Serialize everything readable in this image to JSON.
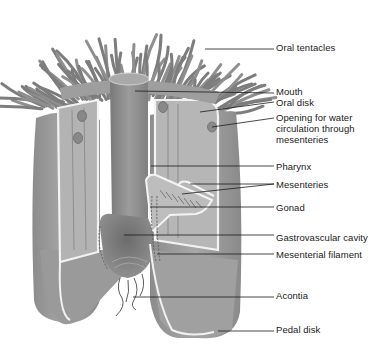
{
  "diagram": {
    "colors": {
      "body": "#9a9a9a",
      "body_light": "#b8b8b8",
      "body_dark": "#6e6e6e",
      "tentacle": "#7d7d7d",
      "edge_highlight": "#f2f2f2",
      "leader_line": "#1a1a1a",
      "text": "#1a1a1a",
      "background": "#ffffff"
    },
    "labels": [
      {
        "id": "oral-tentacles",
        "lines": [
          "Oral tentacles"
        ],
        "x": 276,
        "y": 42,
        "line": {
          "x1": 205,
          "y1": 49,
          "x2": 274,
          "y2": 49
        }
      },
      {
        "id": "mouth",
        "lines": [
          "Mouth"
        ],
        "x": 276,
        "y": 86,
        "line": {
          "x1": 135,
          "y1": 91,
          "x2": 274,
          "y2": 93
        }
      },
      {
        "id": "oral-disk",
        "lines": [
          "Oral disk"
        ],
        "x": 276,
        "y": 97,
        "line": {
          "x1": 200,
          "y1": 112,
          "x2": 274,
          "y2": 102
        }
      },
      {
        "id": "opening-water",
        "lines": [
          "Opening for water",
          "circulation through",
          "mesenteries"
        ],
        "x": 276,
        "y": 112,
        "line": {
          "x1": 212,
          "y1": 127,
          "x2": 274,
          "y2": 118
        }
      },
      {
        "id": "pharynx",
        "lines": [
          "Pharynx"
        ],
        "x": 276,
        "y": 161,
        "line": {
          "x1": 151,
          "y1": 166,
          "x2": 274,
          "y2": 166
        }
      },
      {
        "id": "mesenteries",
        "lines": [
          "Mesenteries"
        ],
        "x": 276,
        "y": 179,
        "line": {
          "x1": 182,
          "y1": 194,
          "x2": 274,
          "y2": 184
        },
        "line2": {
          "x1": 190,
          "y1": 184,
          "x2": 274,
          "y2": 184
        }
      },
      {
        "id": "gonad",
        "lines": [
          "Gonad"
        ],
        "x": 276,
        "y": 202,
        "line": {
          "x1": 150,
          "y1": 207,
          "x2": 274,
          "y2": 207
        }
      },
      {
        "id": "gastrovascular-cavity",
        "lines": [
          "Gastrovascular cavity"
        ],
        "x": 276,
        "y": 232,
        "line": {
          "x1": 124,
          "y1": 235,
          "x2": 274,
          "y2": 235
        }
      },
      {
        "id": "mesenterial-filament",
        "lines": [
          "Mesenterial filament"
        ],
        "x": 276,
        "y": 249,
        "line": {
          "x1": 157,
          "y1": 254,
          "x2": 274,
          "y2": 254
        }
      },
      {
        "id": "acontia",
        "lines": [
          "Acontia"
        ],
        "x": 276,
        "y": 290,
        "line": {
          "x1": 133,
          "y1": 297,
          "x2": 274,
          "y2": 297
        }
      },
      {
        "id": "pedal-disk",
        "lines": [
          "Pedal disk"
        ],
        "x": 276,
        "y": 324,
        "line": {
          "x1": 218,
          "y1": 331,
          "x2": 274,
          "y2": 331
        }
      }
    ]
  }
}
